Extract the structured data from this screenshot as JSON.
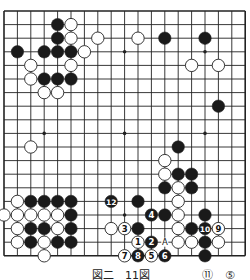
{
  "board": {
    "size": 19,
    "origin_x": 4,
    "origin_y": 11,
    "step_x": 13.4,
    "step_y": 13.6,
    "stone_radius": 6.2,
    "colors": {
      "line": "#222222",
      "black": "#1a1a1a",
      "white": "#ffffff",
      "edge": "#222222"
    },
    "star_points": [
      [
        3,
        3
      ],
      [
        9,
        3
      ],
      [
        15,
        3
      ],
      [
        3,
        9
      ],
      [
        9,
        9
      ],
      [
        15,
        9
      ],
      [
        3,
        15
      ],
      [
        9,
        15
      ],
      [
        15,
        15
      ]
    ],
    "stones": [
      {
        "c": "B",
        "x": 4,
        "y": 1
      },
      {
        "c": "W",
        "x": 5,
        "y": 1
      },
      {
        "c": "B",
        "x": 4,
        "y": 2
      },
      {
        "c": "W",
        "x": 5,
        "y": 2
      },
      {
        "c": "W",
        "x": 7,
        "y": 2
      },
      {
        "c": "W",
        "x": 10,
        "y": 2
      },
      {
        "c": "B",
        "x": 12,
        "y": 2
      },
      {
        "c": "B",
        "x": 15,
        "y": 2
      },
      {
        "c": "B",
        "x": 1,
        "y": 3
      },
      {
        "c": "B",
        "x": 3,
        "y": 3
      },
      {
        "c": "B",
        "x": 4,
        "y": 3
      },
      {
        "c": "B",
        "x": 5,
        "y": 3
      },
      {
        "c": "W",
        "x": 6,
        "y": 3
      },
      {
        "c": "W",
        "x": 2,
        "y": 4
      },
      {
        "c": "W",
        "x": 5,
        "y": 4
      },
      {
        "c": "W",
        "x": 14,
        "y": 4
      },
      {
        "c": "W",
        "x": 16,
        "y": 4
      },
      {
        "c": "W",
        "x": 2,
        "y": 5
      },
      {
        "c": "B",
        "x": 3,
        "y": 5
      },
      {
        "c": "B",
        "x": 4,
        "y": 5
      },
      {
        "c": "B",
        "x": 5,
        "y": 5
      },
      {
        "c": "W",
        "x": 3,
        "y": 6
      },
      {
        "c": "W",
        "x": 4,
        "y": 6
      },
      {
        "c": "B",
        "x": 16,
        "y": 7
      },
      {
        "c": "W",
        "x": 2,
        "y": 10
      },
      {
        "c": "B",
        "x": 13,
        "y": 10
      },
      {
        "c": "W",
        "x": 12,
        "y": 11
      },
      {
        "c": "W",
        "x": 12,
        "y": 12
      },
      {
        "c": "B",
        "x": 13,
        "y": 12
      },
      {
        "c": "B",
        "x": 14,
        "y": 12
      },
      {
        "c": "B",
        "x": 12,
        "y": 13
      },
      {
        "c": "W",
        "x": 13,
        "y": 13
      },
      {
        "c": "B",
        "x": 14,
        "y": 13
      },
      {
        "c": "W",
        "x": 1,
        "y": 14
      },
      {
        "c": "B",
        "x": 2,
        "y": 14
      },
      {
        "c": "B",
        "x": 3,
        "y": 14
      },
      {
        "c": "B",
        "x": 4,
        "y": 14
      },
      {
        "c": "B",
        "x": 5,
        "y": 14
      },
      {
        "c": "B",
        "x": 8,
        "y": 14,
        "n": "12"
      },
      {
        "c": "B",
        "x": 10,
        "y": 14
      },
      {
        "c": "W",
        "x": 13,
        "y": 14
      },
      {
        "c": "W",
        "x": 0,
        "y": 15
      },
      {
        "c": "W",
        "x": 1,
        "y": 15
      },
      {
        "c": "W",
        "x": 2,
        "y": 15
      },
      {
        "c": "W",
        "x": 3,
        "y": 15
      },
      {
        "c": "W",
        "x": 4,
        "y": 15
      },
      {
        "c": "B",
        "x": 5,
        "y": 15
      },
      {
        "c": "B",
        "x": 11,
        "y": 15,
        "n": "4"
      },
      {
        "c": "B",
        "x": 12,
        "y": 15
      },
      {
        "c": "W",
        "x": 13,
        "y": 15
      },
      {
        "c": "B",
        "x": 15,
        "y": 15
      },
      {
        "c": "W",
        "x": 1,
        "y": 16
      },
      {
        "c": "B",
        "x": 2,
        "y": 16
      },
      {
        "c": "B",
        "x": 3,
        "y": 16
      },
      {
        "c": "W",
        "x": 4,
        "y": 16
      },
      {
        "c": "B",
        "x": 5,
        "y": 16
      },
      {
        "c": "W",
        "x": 8,
        "y": 16
      },
      {
        "c": "W",
        "x": 9,
        "y": 16,
        "n": "3"
      },
      {
        "c": "B",
        "x": 10,
        "y": 16
      },
      {
        "c": "W",
        "x": 13,
        "y": 16
      },
      {
        "c": "B",
        "x": 14,
        "y": 16
      },
      {
        "c": "B",
        "x": 15,
        "y": 16,
        "n": "10"
      },
      {
        "c": "W",
        "x": 16,
        "y": 16,
        "n": "9"
      },
      {
        "c": "W",
        "x": 1,
        "y": 17
      },
      {
        "c": "B",
        "x": 2,
        "y": 17
      },
      {
        "c": "W",
        "x": 3,
        "y": 17
      },
      {
        "c": "B",
        "x": 4,
        "y": 17
      },
      {
        "c": "B",
        "x": 5,
        "y": 17
      },
      {
        "c": "W",
        "x": 10,
        "y": 17,
        "n": "1"
      },
      {
        "c": "B",
        "x": 11,
        "y": 17,
        "n": "2"
      },
      {
        "c": "W",
        "x": 13,
        "y": 17
      },
      {
        "c": "W",
        "x": 14,
        "y": 17
      },
      {
        "c": "B",
        "x": 15,
        "y": 17
      },
      {
        "c": "W",
        "x": 16,
        "y": 17
      },
      {
        "c": "W",
        "x": 3,
        "y": 18
      },
      {
        "c": "W",
        "x": 9,
        "y": 18,
        "n": "7"
      },
      {
        "c": "B",
        "x": 10,
        "y": 18,
        "n": "8"
      },
      {
        "c": "W",
        "x": 11,
        "y": 18,
        "n": "5"
      },
      {
        "c": "B",
        "x": 12,
        "y": 18,
        "n": "6"
      },
      {
        "c": "B",
        "x": 15,
        "y": 18
      }
    ],
    "labels": [
      {
        "text": "A",
        "x": 12,
        "y": 17
      }
    ]
  },
  "caption": {
    "left_text": "図二　11図",
    "right_marks": [
      "⑪",
      "⑤"
    ]
  }
}
